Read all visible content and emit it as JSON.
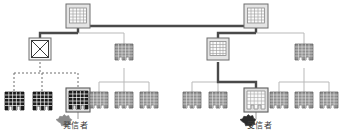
{
  "diagram": {
    "type": "network-topology-tree",
    "title": "",
    "colors": {
      "line_thin": "#b9b9b9",
      "line_thick": "#4a4a4a",
      "line_dotted": "#6e6e6e",
      "node_dark_fill": "#1c1c1c",
      "node_gray_fill": "#8a8a8a",
      "node_light_fill": "#d8d8d8",
      "node_white_fill": "#f2f2f2",
      "node_border_highlight": "#5c5c5c",
      "legend_sender_star": "#8a8a8a",
      "legend_receiver_star": "#2b2b2b",
      "text": "#3a3a3a",
      "background": "#ffffff"
    },
    "legend": [
      {
        "key": "sender",
        "label": "発信者",
        "marker": "star-burst-icon",
        "marker_color": "#8a8a8a"
      },
      {
        "key": "receiver",
        "label": "受信者",
        "marker": "star-burst-icon",
        "marker_color": "#2b2b2b"
      }
    ],
    "nodes": [
      {
        "id": "root-left",
        "shape": "building-icon",
        "style": "light-boxed",
        "x": 78,
        "y": 16,
        "w": 24,
        "h": 24,
        "level": 0
      },
      {
        "id": "root-right",
        "shape": "building-icon",
        "style": "light-boxed",
        "x": 256,
        "y": 16,
        "w": 24,
        "h": 24,
        "level": 0
      },
      {
        "id": "failed-node",
        "shape": "crossed-box-icon",
        "style": "crossed",
        "x": 40,
        "y": 49,
        "w": 22,
        "h": 22,
        "level": 1
      },
      {
        "id": "mid-left-b",
        "shape": "building-icon",
        "style": "gray",
        "x": 124,
        "y": 52,
        "w": 18,
        "h": 16,
        "level": 1
      },
      {
        "id": "mid-right-a",
        "shape": "building-icon",
        "style": "light-boxed",
        "x": 218,
        "y": 49,
        "w": 22,
        "h": 22,
        "level": 1
      },
      {
        "id": "mid-right-b",
        "shape": "building-icon",
        "style": "gray",
        "x": 304,
        "y": 52,
        "w": 18,
        "h": 16,
        "level": 1
      },
      {
        "id": "leaf-d1",
        "shape": "building-icon",
        "style": "dark",
        "x": 14,
        "y": 92,
        "w": 19,
        "h": 17,
        "level": 2
      },
      {
        "id": "leaf-d2",
        "shape": "building-icon",
        "style": "dark",
        "x": 42,
        "y": 92,
        "w": 19,
        "h": 17,
        "level": 2
      },
      {
        "id": "leaf-sender",
        "shape": "building-icon",
        "style": "dark-highlighted",
        "x": 68,
        "y": 92,
        "w": 19,
        "h": 17,
        "level": 2
      },
      {
        "id": "leaf-g1",
        "shape": "building-icon",
        "style": "gray",
        "x": 99,
        "y": 92,
        "w": 18,
        "h": 16,
        "level": 2
      },
      {
        "id": "leaf-g2",
        "shape": "building-icon",
        "style": "gray",
        "x": 124,
        "y": 92,
        "w": 18,
        "h": 16,
        "level": 2
      },
      {
        "id": "leaf-g3",
        "shape": "building-icon",
        "style": "gray",
        "x": 149,
        "y": 92,
        "w": 18,
        "h": 16,
        "level": 2
      },
      {
        "id": "leaf-g4",
        "shape": "building-icon",
        "style": "gray",
        "x": 192,
        "y": 92,
        "w": 18,
        "h": 16,
        "level": 2
      },
      {
        "id": "leaf-g5",
        "shape": "building-icon",
        "style": "gray",
        "x": 218,
        "y": 92,
        "w": 18,
        "h": 16,
        "level": 2
      },
      {
        "id": "leaf-receiver",
        "shape": "building-icon",
        "style": "white-highlighted",
        "x": 246,
        "y": 92,
        "w": 20,
        "h": 18,
        "level": 2
      },
      {
        "id": "leaf-g6",
        "shape": "building-icon",
        "style": "gray",
        "x": 279,
        "y": 92,
        "w": 18,
        "h": 16,
        "level": 2
      },
      {
        "id": "leaf-g7",
        "shape": "building-icon",
        "style": "gray",
        "x": 304,
        "y": 92,
        "w": 18,
        "h": 16,
        "level": 2
      },
      {
        "id": "leaf-g8",
        "shape": "building-icon",
        "style": "gray",
        "x": 329,
        "y": 92,
        "w": 18,
        "h": 16,
        "level": 2
      }
    ],
    "edges": [
      {
        "from": "root-left",
        "to": "root-right",
        "style": "thick"
      },
      {
        "from": "root-left",
        "to": "failed-node",
        "style": "thick"
      },
      {
        "from": "root-left",
        "to": "mid-left-b",
        "style": "thin"
      },
      {
        "from": "root-right",
        "to": "mid-right-a",
        "style": "thick"
      },
      {
        "from": "root-right",
        "to": "mid-right-b",
        "style": "thin"
      },
      {
        "from": "failed-node",
        "to": "leaf-d1",
        "style": "dotted"
      },
      {
        "from": "failed-node",
        "to": "leaf-d2",
        "style": "dotted"
      },
      {
        "from": "failed-node",
        "to": "leaf-sender",
        "style": "dotted"
      },
      {
        "from": "mid-left-b",
        "to": "leaf-g1",
        "style": "thin"
      },
      {
        "from": "mid-left-b",
        "to": "leaf-g2",
        "style": "thin"
      },
      {
        "from": "mid-left-b",
        "to": "leaf-g3",
        "style": "thin"
      },
      {
        "from": "mid-right-a",
        "to": "leaf-g4",
        "style": "thin"
      },
      {
        "from": "mid-right-a",
        "to": "leaf-g5",
        "style": "thin"
      },
      {
        "from": "mid-right-a",
        "to": "leaf-receiver",
        "style": "thick"
      },
      {
        "from": "mid-right-b",
        "to": "leaf-g6",
        "style": "thin"
      },
      {
        "from": "mid-right-b",
        "to": "leaf-g7",
        "style": "thin"
      },
      {
        "from": "mid-right-b",
        "to": "leaf-g8",
        "style": "thin"
      }
    ]
  }
}
